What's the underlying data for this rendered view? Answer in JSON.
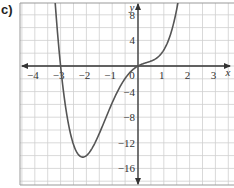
{
  "figure": {
    "part_label": "c)"
  },
  "chart_data": {
    "type": "line",
    "title": "",
    "xlabel": "x",
    "ylabel": "y",
    "xlim": [
      -4.6,
      3.6
    ],
    "ylim": [
      -18.5,
      10
    ],
    "grid": true,
    "grid_minor_x": 0.5,
    "grid_minor_y": 2,
    "x_ticks": [
      -4,
      -3,
      -2,
      -1,
      0,
      1,
      2,
      3
    ],
    "x_tick_labels": [
      "−4",
      "−3",
      "−2",
      "−1",
      "0",
      "1",
      "2",
      "3"
    ],
    "y_ticks": [
      8,
      4,
      -4,
      -8,
      -12,
      -16
    ],
    "y_tick_labels": [
      "8",
      "4",
      "−4",
      "−8",
      "−12",
      "−16"
    ],
    "legend": null,
    "series": [
      {
        "name": "curve",
        "color": "#555555",
        "x": [
          -3.3,
          -3.2,
          -3.1,
          -3.0,
          -2.9,
          -2.8,
          -2.6,
          -2.4,
          -2.2,
          -2.0,
          -1.8,
          -1.6,
          -1.4,
          -1.2,
          -1.0,
          -0.8,
          -0.6,
          -0.4,
          -0.2,
          0.0,
          0.2,
          0.4,
          0.6,
          0.8,
          1.0,
          1.2,
          1.4,
          1.6,
          1.8,
          2.0,
          2.1,
          2.2,
          2.3
        ],
        "y": [
          10.9,
          6.9,
          3.3,
          0.0,
          -2.9,
          -5.5,
          -9.4,
          -12.1,
          -13.6,
          -14.0,
          -13.5,
          -12.3,
          -10.6,
          -8.6,
          -6.5,
          -4.5,
          -2.7,
          -1.3,
          -0.4,
          0.0,
          0.6,
          1.3,
          1.8,
          2.2,
          2.5,
          2.8,
          3.5,
          5.0,
          7.8,
          12.5,
          15.5,
          19.1,
          23.3
        ]
      }
    ],
    "annotations": {
      "root": [
        -3,
        0
      ],
      "minimum": [
        -2,
        -14
      ],
      "passes_through_origin": true
    }
  },
  "colors": {
    "grid": "#cfcfcf",
    "axis": "#333333",
    "curve": "#555555",
    "frame": "#999999"
  }
}
